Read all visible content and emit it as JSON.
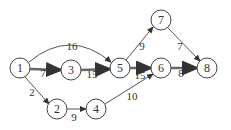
{
  "diagram": {
    "type": "network-graph",
    "nodes": [
      {
        "id": "1",
        "label": "1",
        "x": 20,
        "y": 68
      },
      {
        "id": "3",
        "label": "3",
        "x": 71,
        "y": 70
      },
      {
        "id": "5",
        "label": "5",
        "x": 120,
        "y": 68
      },
      {
        "id": "7",
        "label": "7",
        "x": 161,
        "y": 20
      },
      {
        "id": "6",
        "label": "6",
        "x": 161,
        "y": 68
      },
      {
        "id": "8",
        "label": "8",
        "x": 207,
        "y": 68
      },
      {
        "id": "2",
        "label": "2",
        "x": 57,
        "y": 109
      },
      {
        "id": "4",
        "label": "4",
        "x": 96,
        "y": 109
      }
    ],
    "edges": [
      {
        "from": "1",
        "to": "5",
        "weight": "16",
        "critical": false,
        "curved": true
      },
      {
        "from": "1",
        "to": "3",
        "weight": "7",
        "critical": true
      },
      {
        "from": "3",
        "to": "5",
        "weight": "15",
        "critical": true
      },
      {
        "from": "1",
        "to": "2",
        "weight": "2",
        "critical": false
      },
      {
        "from": "2",
        "to": "4",
        "weight": "9",
        "critical": false
      },
      {
        "from": "4",
        "to": "6",
        "weight": "10",
        "critical": false
      },
      {
        "from": "5",
        "to": "7",
        "weight": "9",
        "critical": false
      },
      {
        "from": "5",
        "to": "6",
        "weight": "15",
        "critical": true
      },
      {
        "from": "7",
        "to": "8",
        "weight": "7",
        "critical": false
      },
      {
        "from": "6",
        "to": "8",
        "weight": "8",
        "critical": true
      }
    ]
  }
}
